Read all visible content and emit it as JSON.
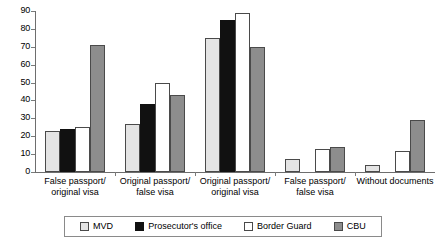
{
  "chart_data": {
    "type": "bar",
    "title": "",
    "xlabel": "",
    "ylabel": "",
    "ylim": [
      0,
      90
    ],
    "yticks": [
      0,
      10,
      20,
      30,
      40,
      50,
      60,
      70,
      80,
      90
    ],
    "grid": false,
    "legend_position": "bottom",
    "categories": [
      "False passport/ original visa",
      "Original passport/ false visa",
      "Original passport/ original visa",
      "False passport/ false visa",
      "Without documents"
    ],
    "category_lines": [
      [
        "False passport/",
        "original visa"
      ],
      [
        "Original passport/",
        "false visa"
      ],
      [
        "Original passport/",
        "original visa"
      ],
      [
        "False passport/",
        "false visa"
      ],
      [
        "Without documents",
        ""
      ]
    ],
    "series": [
      {
        "name": "MVD",
        "color": "#e4e4e4",
        "values": [
          23,
          27,
          75,
          7,
          4
        ]
      },
      {
        "name": "Prosecutor's office",
        "color": "#111111",
        "values": [
          24,
          38,
          85,
          0,
          0
        ]
      },
      {
        "name": "Border Guard",
        "color": "#ffffff",
        "values": [
          25,
          50,
          89,
          13,
          12
        ]
      },
      {
        "name": "CBU",
        "color": "#8d8d8d",
        "values": [
          71,
          43,
          70,
          14,
          29
        ]
      }
    ]
  },
  "legend": {
    "items": [
      {
        "label": "MVD",
        "swatch": "light-gray"
      },
      {
        "label": "Prosecutor's office",
        "swatch": "black"
      },
      {
        "label": "Border Guard",
        "swatch": "white"
      },
      {
        "label": "CBU",
        "swatch": "medium-gray"
      }
    ]
  }
}
